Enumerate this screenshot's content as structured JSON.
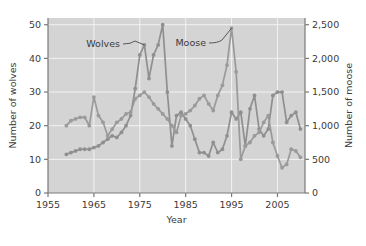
{
  "chart_data": {
    "type": "line",
    "title": "",
    "xlabel": "Year",
    "ylabel": "Number of wolves",
    "y2label": "Number of moose",
    "xlim": [
      1955,
      2011
    ],
    "ylim": [
      0,
      52
    ],
    "y2lim": [
      0,
      2600
    ],
    "xticks": [
      1955,
      1965,
      1975,
      1985,
      1995,
      2005
    ],
    "xtick_labels": [
      "1955",
      "1965",
      "1975",
      "1985",
      "1995",
      "2005"
    ],
    "yticks": [
      0,
      10,
      20,
      30,
      40,
      50
    ],
    "ytick_labels": [
      "0",
      "10",
      "20",
      "30",
      "40",
      "50"
    ],
    "y2ticks": [
      0,
      500,
      1000,
      1500,
      2000,
      2500
    ],
    "y2tick_labels": [
      "0",
      "500",
      "1,000",
      "1,500",
      "2,000",
      "2,500"
    ],
    "grid": true,
    "legend_position": "inline-annotations",
    "plot_background": "#d4d4d4",
    "gridline_color": "#f2f2f2",
    "series": [
      {
        "name": "Wolves",
        "axis": "left",
        "color": "#8f8f8f",
        "marker": "circle",
        "x": [
          1959,
          1960,
          1961,
          1962,
          1963,
          1964,
          1965,
          1966,
          1967,
          1968,
          1969,
          1970,
          1971,
          1972,
          1973,
          1974,
          1975,
          1976,
          1977,
          1978,
          1979,
          1980,
          1981,
          1982,
          1983,
          1984,
          1985,
          1986,
          1987,
          1988,
          1989,
          1990,
          1991,
          1992,
          1993,
          1994,
          1995,
          1996,
          1997,
          1998,
          1999,
          2000,
          2001,
          2002,
          2003,
          2004,
          2005,
          2006,
          2007,
          2008,
          2009,
          2010
        ],
        "values": [
          11.5,
          12,
          12.5,
          13,
          13,
          13,
          13.5,
          14,
          15,
          16,
          17,
          16.5,
          18,
          20,
          23,
          31,
          41,
          44,
          34,
          41,
          44,
          50,
          30,
          14,
          23,
          24,
          22,
          20,
          16,
          12,
          12,
          11,
          15,
          12,
          13,
          17,
          24,
          22,
          24,
          14,
          25,
          29,
          19,
          17,
          19,
          29,
          30,
          30,
          21,
          23,
          24,
          19
        ]
      },
      {
        "name": "Moose",
        "axis": "right",
        "color": "#9a9a9a",
        "marker": "circle",
        "x": [
          1959,
          1960,
          1961,
          1962,
          1963,
          1964,
          1965,
          1966,
          1967,
          1968,
          1969,
          1970,
          1971,
          1972,
          1973,
          1974,
          1975,
          1976,
          1977,
          1978,
          1979,
          1980,
          1981,
          1982,
          1983,
          1984,
          1985,
          1986,
          1987,
          1988,
          1989,
          1990,
          1991,
          1992,
          1993,
          1994,
          1995,
          1996,
          1997,
          1998,
          1999,
          2000,
          2001,
          2002,
          2003,
          2004,
          2005,
          2006,
          2007,
          2008,
          2009,
          2010
        ],
        "values": [
          1000,
          1075,
          1100,
          1125,
          1125,
          1000,
          1425,
          1150,
          1050,
          850,
          950,
          1050,
          1100,
          1175,
          1200,
          1400,
          1450,
          1500,
          1425,
          1325,
          1250,
          1175,
          1100,
          1000,
          900,
          1150,
          1175,
          1225,
          1300,
          1400,
          1450,
          1325,
          1225,
          1450,
          1600,
          1900,
          2450,
          1800,
          500,
          700,
          750,
          850,
          900,
          1050,
          1150,
          750,
          550,
          375,
          425,
          650,
          625,
          530
        ]
      }
    ],
    "annotations": [
      {
        "text": "Wolves",
        "points_to_year": 1976,
        "points_to_value": 44
      },
      {
        "text": "Moose",
        "points_to_year": 1995,
        "points_to_value": 2450
      }
    ]
  }
}
